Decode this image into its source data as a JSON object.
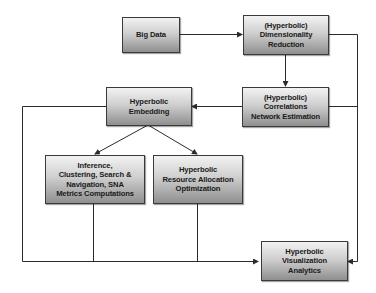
{
  "diagram": {
    "nodes": {
      "big_data": {
        "lines": [
          "Big Data"
        ]
      },
      "dim_reduction": {
        "lines": [
          "(Hyperbolic)",
          "Dimensionality",
          "Reduction"
        ]
      },
      "corr_network": {
        "lines": [
          "(Hyperbolic)",
          "Correlations",
          "Network Estimation"
        ]
      },
      "embedding": {
        "lines": [
          "Hyperbolic",
          "Embedding"
        ]
      },
      "inference": {
        "lines": [
          "Inference,",
          "Clustering, Search &",
          "Navigation, SNA",
          "Metrics Computations"
        ]
      },
      "resource_alloc": {
        "lines": [
          "Hyperbolic",
          "Resource Allocation",
          "Optimization"
        ]
      },
      "visualization": {
        "lines": [
          "Hyperbolic",
          "Visualization",
          "Analytics"
        ]
      }
    },
    "edges": [
      {
        "from": "big_data",
        "to": "dim_reduction"
      },
      {
        "from": "dim_reduction",
        "to": "corr_network"
      },
      {
        "from": "dim_reduction",
        "to": "visualization"
      },
      {
        "from": "corr_network",
        "to": "embedding"
      },
      {
        "from": "corr_network",
        "to": "visualization"
      },
      {
        "from": "embedding",
        "to": "inference"
      },
      {
        "from": "embedding",
        "to": "resource_alloc"
      },
      {
        "from": "embedding",
        "to": "visualization"
      },
      {
        "from": "inference",
        "to": "visualization"
      },
      {
        "from": "resource_alloc",
        "to": "visualization"
      }
    ],
    "colors": {
      "line": "#2b2b2b",
      "box_top": "#f2f2f2",
      "box_bottom": "#8f8f8f",
      "border": "#3a3a3a"
    }
  }
}
